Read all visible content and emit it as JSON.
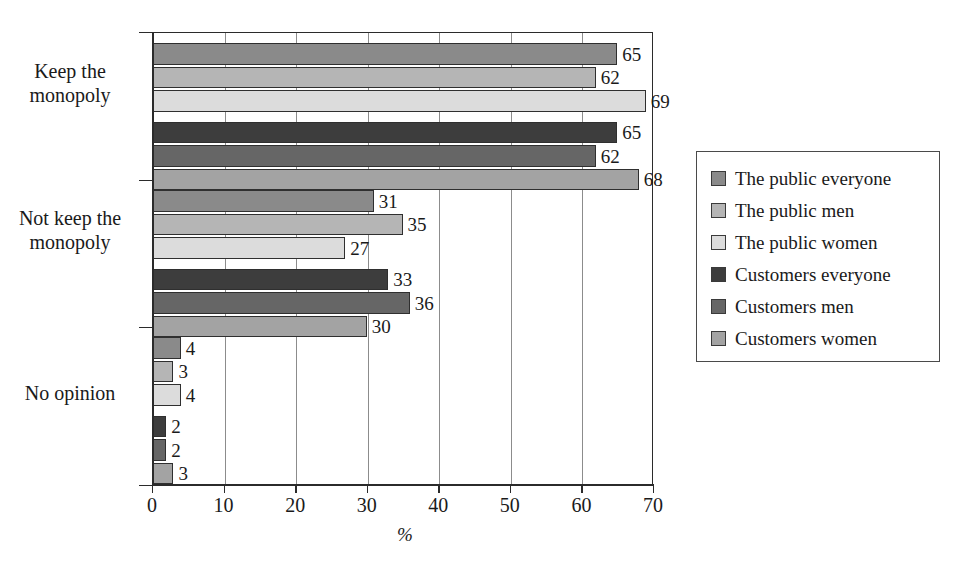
{
  "chart_data": {
    "type": "bar",
    "orientation": "horizontal",
    "title": "",
    "xlabel": "%",
    "ylabel": "",
    "xlim": [
      0,
      70
    ],
    "xticks": [
      "0",
      "10",
      "20",
      "30",
      "40",
      "50",
      "60",
      "70"
    ],
    "grid": true,
    "grid_axis": "x",
    "legend_position": "right",
    "categories": [
      "Keep the monopoly",
      "Not keep the monopoly",
      "No opinion"
    ],
    "series": [
      {
        "name": "The public everyone",
        "color": "#8a8a8a",
        "values": [
          65,
          31,
          4
        ]
      },
      {
        "name": "The public men",
        "color": "#b5b5b5",
        "values": [
          62,
          35,
          3
        ]
      },
      {
        "name": "The public women",
        "color": "#dcdcdc",
        "values": [
          69,
          27,
          4
        ]
      },
      {
        "name": "Customers everyone",
        "color": "#3d3d3d",
        "values": [
          65,
          33,
          2
        ]
      },
      {
        "name": "Customers men",
        "color": "#666666",
        "values": [
          62,
          36,
          2
        ]
      },
      {
        "name": "Customers women",
        "color": "#a3a3a3",
        "values": [
          68,
          30,
          3
        ]
      }
    ]
  },
  "legend": {
    "items": [
      {
        "label": "The public everyone",
        "color": "#8a8a8a"
      },
      {
        "label": "The public men",
        "color": "#b5b5b5"
      },
      {
        "label": "The public women",
        "color": "#dcdcdc"
      },
      {
        "label": "Customers everyone",
        "color": "#3d3d3d"
      },
      {
        "label": "Customers men",
        "color": "#666666"
      },
      {
        "label": "Customers women",
        "color": "#a3a3a3"
      }
    ]
  },
  "axis": {
    "x_title": "%",
    "x_tick_labels": [
      "0",
      "10",
      "20",
      "30",
      "40",
      "50",
      "60",
      "70"
    ],
    "category_labels": [
      "Keep the\nmonopoly",
      "Not keep the\nmonopoly",
      "No opinion"
    ]
  }
}
